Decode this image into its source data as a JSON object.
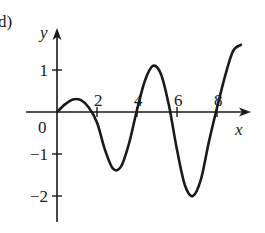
{
  "panel_label": "d)",
  "chart_data": {
    "type": "line",
    "title": "",
    "xlabel": "x",
    "ylabel": "y",
    "origin_label": "0",
    "x_ticks": [
      {
        "value": 2,
        "label": "2"
      },
      {
        "value": 4,
        "label": "4"
      },
      {
        "value": 6,
        "label": "6"
      },
      {
        "value": 8,
        "label": "8"
      }
    ],
    "y_ticks": [
      {
        "value": 1,
        "label": "1"
      },
      {
        "value": -1,
        "label": "−1"
      },
      {
        "value": -2,
        "label": "−2"
      }
    ],
    "xlim": [
      -0.5,
      9.3
    ],
    "ylim": [
      -2.5,
      2.1
    ],
    "grid": false,
    "series": [
      {
        "name": "curve",
        "x": [
          0,
          0.4,
          0.8,
          1.2,
          1.6,
          2.0,
          2.4,
          2.8,
          3.2,
          3.6,
          4.0,
          4.4,
          4.8,
          5.2,
          5.6,
          6.0,
          6.4,
          6.8,
          7.2,
          7.6,
          8.0,
          8.4,
          8.8,
          9.2
        ],
        "values": [
          0,
          0.18,
          0.3,
          0.28,
          0.1,
          -0.25,
          -0.9,
          -1.35,
          -1.3,
          -0.75,
          0.05,
          0.75,
          1.1,
          0.9,
          0.15,
          -0.9,
          -1.75,
          -2.0,
          -1.6,
          -0.7,
          0.1,
          0.85,
          1.45,
          1.6
        ]
      }
    ]
  }
}
